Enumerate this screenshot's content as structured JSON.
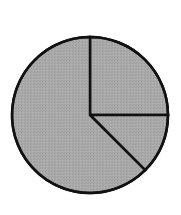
{
  "chart_data": {
    "type": "pie",
    "title": "",
    "categories": [
      "Slice A",
      "Slice B",
      "Slice C"
    ],
    "values": [
      25,
      12.5,
      62.5
    ],
    "units": "percent (estimated from geometry, unlabeled)",
    "start_angle_deg": 0,
    "direction": "clockwise",
    "legend": null,
    "data_labels": false,
    "colors": {
      "fill": "#a9a9a9",
      "stroke": "#111111",
      "background": "#ffffff"
    },
    "geometry": {
      "cx": 90,
      "cy": 115,
      "r": 78,
      "stroke_width": 2.5
    }
  }
}
